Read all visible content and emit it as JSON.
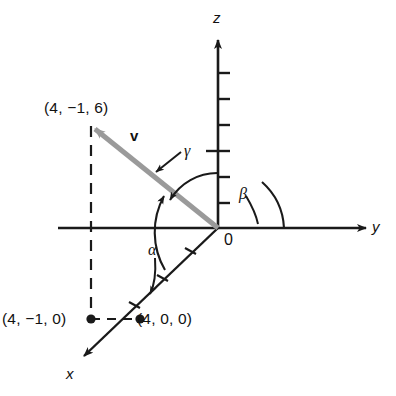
{
  "figure": {
    "background": "#ffffff",
    "stroke_color": "#1a1a1a",
    "vector_color": "#9a9a9a",
    "width": 396,
    "height": 396
  },
  "axes": {
    "z": {
      "label": "z",
      "label_x": 213,
      "label_y": 10,
      "tick_count": 6
    },
    "y": {
      "label": "y",
      "label_x": 372,
      "label_y": 219
    },
    "x": {
      "label": "x",
      "label_x": 66,
      "label_y": 366,
      "tick_count": 3
    },
    "origin": {
      "label": "0",
      "label_x": 224,
      "label_y": 232
    }
  },
  "vector": {
    "name": "v",
    "label": "v",
    "label_x": 130,
    "label_y": 128,
    "tip": "(4, -1, 6)",
    "tail": "(0, 0, 0)",
    "color": "#9a9a9a"
  },
  "points": [
    {
      "name": "vector-tip",
      "label": "(4, −1, 6)",
      "label_x": 44,
      "label_y": 100
    },
    {
      "name": "xy-projection",
      "label": "(4, −1, 0)",
      "label_x": 2,
      "label_y": 311
    },
    {
      "name": "x-intercept",
      "label": "(4, 0, 0)",
      "label_x": 137,
      "label_y": 311
    }
  ],
  "angles": [
    {
      "name": "alpha",
      "label": "α",
      "label_x": 148,
      "label_y": 242,
      "between": "v and x-axis"
    },
    {
      "name": "beta",
      "label": "β",
      "label_x": 239,
      "label_y": 186,
      "between": "v and y-axis"
    },
    {
      "name": "gamma",
      "label": "γ",
      "label_x": 184,
      "label_y": 143,
      "between": "v and z-axis"
    }
  ]
}
